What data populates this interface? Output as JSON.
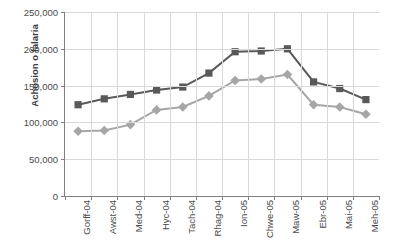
{
  "chart_data": {
    "type": "line",
    "title": "",
    "xlabel": "",
    "ylabel": "Achosion o falaria",
    "ylim": [
      0,
      250000
    ],
    "ytick_values": [
      0,
      50000,
      100000,
      150000,
      200000,
      250000
    ],
    "ytick_labels": [
      "0",
      "50,000",
      "100,000",
      "150,000",
      "200,000",
      "250,000"
    ],
    "grid": "horizontal-and-vertical",
    "legend": "none",
    "categories": [
      "Gorff-04",
      "Awst-04",
      "Med-04",
      "Hyc-04",
      "Tach-04",
      "Rhag-04",
      "Ion-05",
      "Chwe-05",
      "Maw-05",
      "Ebr-05",
      "Mai-05",
      "Meh-05"
    ],
    "series": [
      {
        "name": "series-dark",
        "marker": "square",
        "color": "#595959",
        "values": [
          124000,
          132000,
          138000,
          144000,
          148000,
          167000,
          196000,
          197000,
          200000,
          155000,
          146000,
          131000
        ]
      },
      {
        "name": "series-light",
        "marker": "diamond",
        "color": "#a6a6a6",
        "values": [
          88000,
          89000,
          97000,
          117000,
          121000,
          136000,
          157000,
          159000,
          165000,
          124000,
          121000,
          111000
        ]
      }
    ]
  },
  "annotations": {
    "ghost_header": ""
  }
}
